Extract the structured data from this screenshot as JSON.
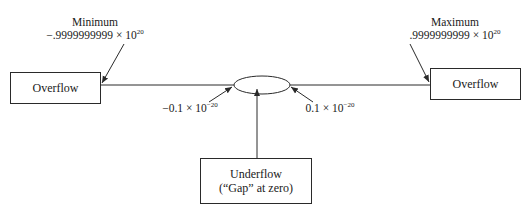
{
  "diagram": {
    "type": "number-line-overflow-underflow",
    "left_box": {
      "label": "Overflow"
    },
    "right_box": {
      "label": "Overflow"
    },
    "underflow_box": {
      "line1": "Underflow",
      "line2": "(“Gap” at zero)"
    },
    "minimum": {
      "title": "Minimum",
      "mantissa": "−.9999999999 × 10",
      "exponent": "20"
    },
    "maximum": {
      "title": "Maximum",
      "mantissa": ".9999999999 × 10",
      "exponent": "20"
    },
    "neg_small": {
      "mantissa": "−0.1 × 10",
      "exponent": "−20"
    },
    "pos_small": {
      "mantissa": "0.1 × 10",
      "exponent": "−20"
    },
    "colors": {
      "line": "#2a2a2a",
      "text": "#1a1a1a",
      "background": "#ffffff"
    }
  }
}
